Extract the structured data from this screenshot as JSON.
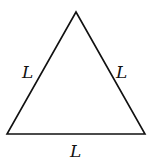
{
  "diagram": {
    "type": "equilateral-triangle",
    "vertices": {
      "top": [
        76,
        12
      ],
      "bottom_left": [
        7,
        134
      ],
      "bottom_right": [
        145,
        134
      ]
    },
    "stroke_color": "#111111",
    "labels": {
      "left_side": "L",
      "right_side": "L",
      "bottom_side": "L"
    }
  }
}
